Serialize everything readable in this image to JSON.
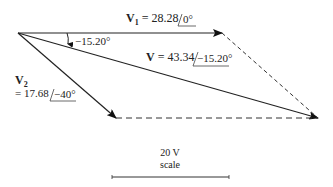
{
  "diagram": {
    "type": "phasor-addition",
    "colors": {
      "line": "#222222",
      "dashed": "#333333",
      "background": "#ffffff"
    },
    "v1": {
      "symbol": "V",
      "subscript": "1",
      "equals": " = 28.28",
      "magnitude": "28.28",
      "angle": "0°"
    },
    "v2": {
      "symbol": "V",
      "subscript": "2",
      "equals": "= 17.68",
      "magnitude": "17.68",
      "angle": "−40°"
    },
    "v": {
      "symbol": "V",
      "equals": " = 43.34",
      "magnitude": "43.34",
      "angle": "−15.20°"
    },
    "angle_marker": {
      "label": "−15.20°"
    },
    "scale": {
      "value": "20 V",
      "label": "scale"
    }
  }
}
